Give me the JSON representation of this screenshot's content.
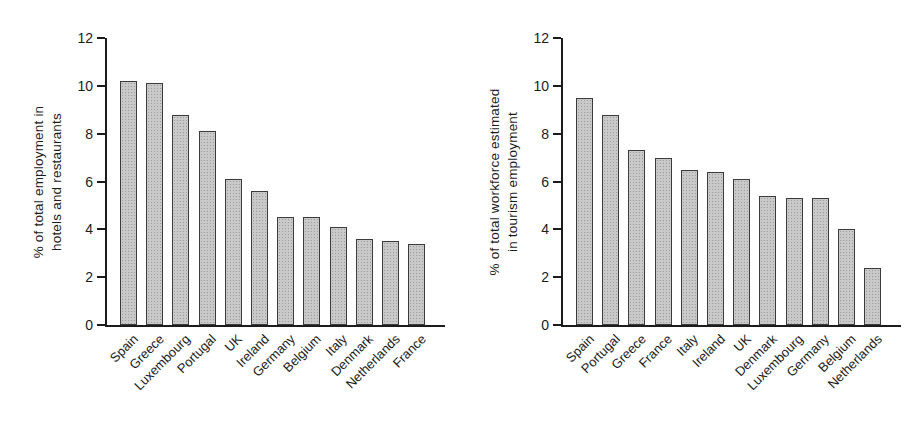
{
  "figure": {
    "background": "#ffffff"
  },
  "colors": {
    "axis": "#1c1c1c",
    "text": "#1c1c1c",
    "bar_fill": "#c9c9c9",
    "bar_dot": "#9c9c9c",
    "bar_border": "#3c3c3c"
  },
  "chart_data": [
    {
      "type": "bar",
      "title": "",
      "xlabel": "",
      "ylabel": "% of total employment in hotels and restaurants",
      "ylabel_lines": [
        "% of total employment in",
        "hotels and restaurants"
      ],
      "categories": [
        "Spain",
        "Greece",
        "Luxembourg",
        "Portugal",
        "UK",
        "Ireland",
        "Germany",
        "Belgium",
        "Italy",
        "Denmark",
        "Netherlands",
        "France"
      ],
      "values": [
        10.2,
        10.1,
        8.8,
        8.1,
        6.1,
        5.6,
        4.5,
        4.5,
        4.1,
        3.6,
        3.5,
        3.4
      ],
      "ylim": [
        0,
        12
      ],
      "yticks": [
        0,
        2,
        4,
        6,
        8,
        10,
        12
      ],
      "grid": false,
      "legend": "none"
    },
    {
      "type": "bar",
      "title": "",
      "xlabel": "",
      "ylabel": "% of total workforce estimated in tourism employment",
      "ylabel_lines": [
        "% of total workforce estimated",
        "in tourism employment"
      ],
      "categories": [
        "Spain",
        "Portugal",
        "Greece",
        "France",
        "Italy",
        "Ireland",
        "UK",
        "Denmark",
        "Luxembourg",
        "Germany",
        "Belgium",
        "Netherlands"
      ],
      "values": [
        9.5,
        8.8,
        7.3,
        7.0,
        6.5,
        6.4,
        6.1,
        5.4,
        5.3,
        5.3,
        4.0,
        2.4
      ],
      "ylim": [
        0,
        12
      ],
      "yticks": [
        0,
        2,
        4,
        6,
        8,
        10,
        12
      ],
      "grid": false,
      "legend": "none"
    }
  ]
}
